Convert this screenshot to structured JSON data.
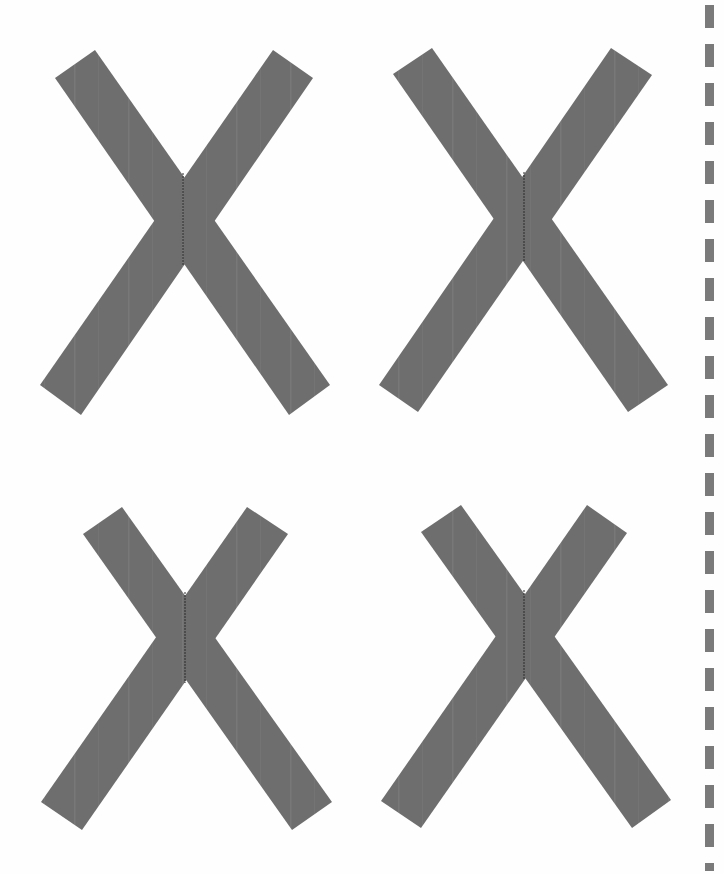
{
  "page": {
    "background": "#fefefe",
    "shape_color": "#6e6e6e",
    "seam_color": "#2a2a2a",
    "guide_color": "#7a7a7a"
  },
  "shapes": [
    {
      "name": "x-mark-top-left",
      "arm_a": [
        [
          55,
          78
        ],
        [
          95,
          50
        ],
        [
          330,
          385
        ],
        [
          289,
          415
        ]
      ],
      "arm_b": [
        [
          273,
          50
        ],
        [
          313,
          78
        ],
        [
          81,
          415
        ],
        [
          40,
          385
        ]
      ],
      "seam": [
        [
          183,
          173
        ],
        [
          183,
          265
        ]
      ]
    },
    {
      "name": "x-mark-top-right",
      "arm_a": [
        [
          393,
          74
        ],
        [
          432,
          48
        ],
        [
          668,
          385
        ],
        [
          628,
          412
        ]
      ],
      "arm_b": [
        [
          611,
          48
        ],
        [
          652,
          75
        ],
        [
          418,
          412
        ],
        [
          379,
          385
        ]
      ],
      "seam": [
        [
          524,
          172
        ],
        [
          524,
          262
        ]
      ]
    },
    {
      "name": "x-mark-bottom-left",
      "arm_a": [
        [
          83,
          534
        ],
        [
          122,
          507
        ],
        [
          332,
          802
        ],
        [
          292,
          830
        ]
      ],
      "arm_b": [
        [
          247,
          507
        ],
        [
          288,
          534
        ],
        [
          82,
          830
        ],
        [
          41,
          802
        ]
      ],
      "seam": [
        [
          185,
          592
        ],
        [
          185,
          683
        ]
      ]
    },
    {
      "name": "x-mark-bottom-right",
      "arm_a": [
        [
          421,
          532
        ],
        [
          461,
          505
        ],
        [
          671,
          800
        ],
        [
          632,
          828
        ]
      ],
      "arm_b": [
        [
          587,
          505
        ],
        [
          627,
          533
        ],
        [
          421,
          828
        ],
        [
          381,
          801
        ]
      ],
      "seam": [
        [
          524,
          590
        ],
        [
          524,
          680
        ]
      ]
    }
  ],
  "guide": {
    "name": "dashed-cut-line",
    "x": 705,
    "dash_height": 23,
    "period": 39
  }
}
